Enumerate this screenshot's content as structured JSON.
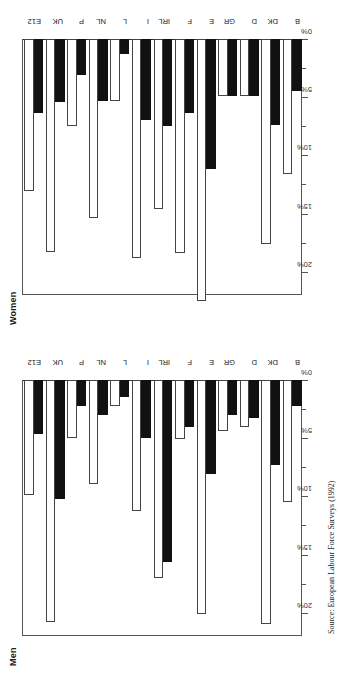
{
  "figure": {
    "source_note": "Source: European Labour Force Surveys (1992)",
    "axis_unit": "%",
    "series_names": [
      "black-series",
      "white-series"
    ]
  },
  "chart_data": [
    {
      "type": "bar",
      "title": "Men",
      "orientation": "horizontal",
      "xlabel": "",
      "ylabel": "",
      "xlim": [
        0,
        22
      ],
      "grid": false,
      "legend": "none",
      "tick_labels": [
        "0%",
        "5%",
        "10%",
        "15%",
        "20%"
      ],
      "tick_values": [
        0,
        5,
        10,
        15,
        20
      ],
      "minor_tick_values": [
        2.5,
        7.5,
        12.5,
        17.5
      ],
      "categories": [
        "B",
        "DK",
        "D",
        "GR",
        "E",
        "F",
        "IRL",
        "I",
        "L",
        "NL",
        "P",
        "UK",
        "E12"
      ],
      "series": [
        {
          "name": "black-series",
          "values": [
            2.2,
            7.3,
            3.3,
            3.0,
            8.1,
            4.0,
            15.6,
            5.0,
            1.5,
            3.0,
            2.2,
            10.2,
            4.6
          ]
        },
        {
          "name": "white-series",
          "values": [
            10.5,
            21.0,
            4.0,
            4.4,
            20.1,
            5.1,
            17.0,
            11.3,
            2.2,
            8.9,
            5.0,
            20.8,
            9.9
          ]
        }
      ]
    },
    {
      "type": "bar",
      "title": "Women",
      "orientation": "horizontal",
      "xlabel": "",
      "ylabel": "",
      "xlim": [
        0,
        22
      ],
      "grid": false,
      "legend": "none",
      "tick_labels": [
        "0%",
        "5%",
        "10%",
        "15%",
        "20%"
      ],
      "tick_values": [
        0,
        5,
        10,
        15,
        20
      ],
      "minor_tick_values": [
        2.5,
        7.5,
        12.5,
        17.5
      ],
      "categories": [
        "B",
        "DK",
        "D",
        "GR",
        "E",
        "F",
        "IRL",
        "I",
        "L",
        "NL",
        "P",
        "UK",
        "E12"
      ],
      "series": [
        {
          "name": "black-series",
          "values": [
            4.5,
            7.4,
            4.9,
            4.9,
            11.2,
            6.4,
            7.5,
            7.0,
            1.3,
            5.3,
            3.1,
            5.4,
            6.4
          ]
        },
        {
          "name": "white-series",
          "values": [
            11.6,
            17.6,
            4.9,
            4.9,
            22.5,
            18.4,
            14.6,
            18.8,
            5.3,
            15.4,
            7.5,
            18.3,
            13.1
          ]
        }
      ]
    }
  ]
}
